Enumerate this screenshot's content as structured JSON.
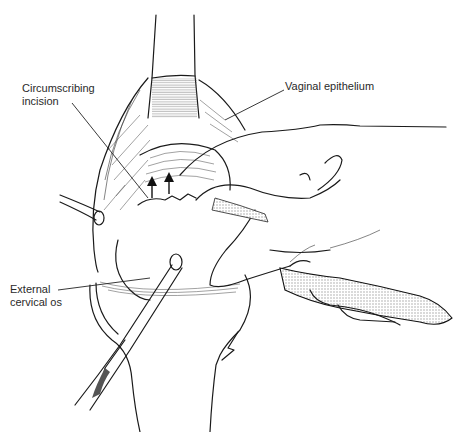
{
  "figure": {
    "type": "surgical-illustration",
    "labels": [
      {
        "id": "circumscribing-incision",
        "text": "Circumscribing\nincision",
        "x": 22,
        "y": 83
      },
      {
        "id": "vaginal-epithelium",
        "text": "Vaginal epithelium",
        "x": 285,
        "y": 80
      },
      {
        "id": "external-cervical-os",
        "text": "External\ncervical os",
        "x": 10,
        "y": 284
      }
    ],
    "arrows": {
      "count": 2,
      "direction": "up"
    },
    "colors": {
      "ink": "#1a1a1a",
      "background": "#ffffff",
      "stipple": "#bdbdbd"
    }
  }
}
